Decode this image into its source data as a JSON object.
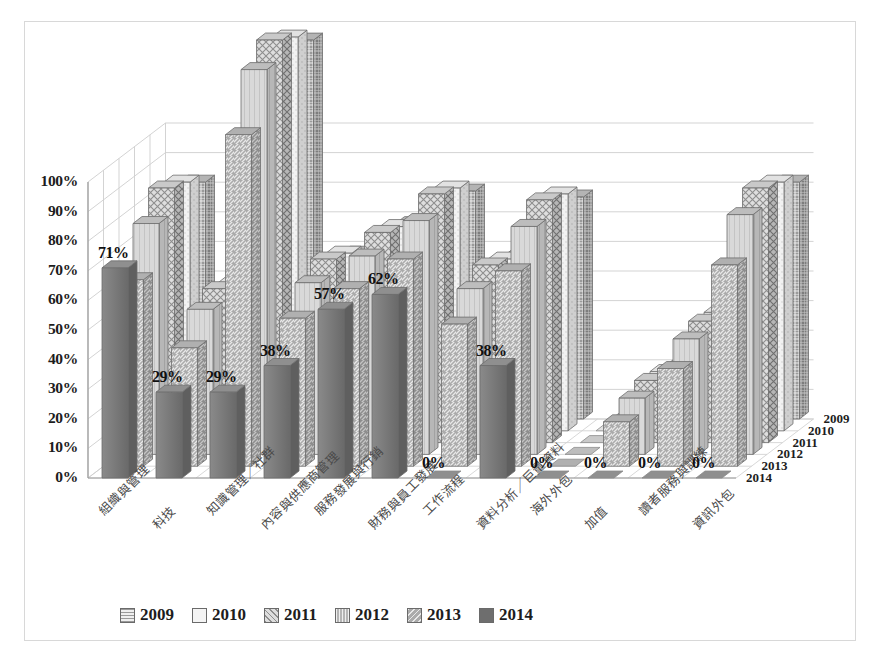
{
  "chart_data": {
    "type": "bar",
    "title": "",
    "subtitle": "",
    "xlabel": "",
    "ylabel": "",
    "zlabel": "",
    "ylim": [
      0,
      100
    ],
    "yticks": [
      "0%",
      "10%",
      "20%",
      "30%",
      "40%",
      "50%",
      "60%",
      "70%",
      "80%",
      "90%",
      "100%"
    ],
    "ytick_values": [
      0,
      10,
      20,
      30,
      40,
      50,
      60,
      70,
      80,
      90,
      100
    ],
    "grid": true,
    "projection": "3d",
    "legend_position": "bottom",
    "categories": [
      "組織與管理",
      "科技",
      "知識管理／社群",
      "內容與供應商管理",
      "服務發展與行銷",
      "財務與員工發展",
      "工作流程",
      "資料分析／巨量資料",
      "海外外包",
      "加值",
      "讀者服務與訓練",
      "資訊外包"
    ],
    "z_categories": [
      "2009",
      "2010",
      "2011",
      "2012",
      "2013",
      "2014"
    ],
    "series": [
      {
        "name": "2009",
        "values": [
          80,
          47,
          128,
          56,
          66,
          77,
          55,
          75,
          0,
          18,
          38,
          80
        ]
      },
      {
        "name": "2010",
        "values": [
          84,
          50,
          133,
          60,
          69,
          82,
          58,
          80,
          0,
          20,
          40,
          84
        ]
      },
      {
        "name": "2011",
        "values": [
          86,
          52,
          136,
          62,
          71,
          84,
          60,
          82,
          0,
          21,
          41,
          86
        ]
      },
      {
        "name": "2012",
        "values": [
          78,
          49,
          130,
          58,
          67,
          79,
          56,
          77,
          0,
          19,
          39,
          81
        ]
      },
      {
        "name": "2013",
        "values": [
          63,
          40,
          112,
          50,
          60,
          70,
          48,
          66,
          0,
          15,
          33,
          68
        ]
      },
      {
        "name": "2014",
        "values": [
          71,
          29,
          29,
          38,
          57,
          62,
          0,
          38,
          0,
          0,
          0,
          0
        ]
      }
    ],
    "data_labels": [
      {
        "category": "組織與管理",
        "text": "71%"
      },
      {
        "category": "科技",
        "text": "29%"
      },
      {
        "category": "知識管理／社群",
        "text": "29%"
      },
      {
        "category": "內容與供應商管理",
        "text": "38%"
      },
      {
        "category": "服務發展與行銷",
        "text": "57%"
      },
      {
        "category": "財務與員工發展",
        "text": "62%"
      },
      {
        "category": "工作流程",
        "text": "0%"
      },
      {
        "category": "資料分析／巨量資料",
        "text": "38%"
      },
      {
        "category": "海外外包",
        "text": "0%"
      },
      {
        "category": "加值",
        "text": "0%"
      },
      {
        "category": "讀者服務與訓練",
        "text": "0%"
      },
      {
        "category": "資訊外包",
        "text": "0%"
      }
    ],
    "legend": [
      {
        "label": "2009",
        "pattern": "grid-dense",
        "color": "#8c8c8c"
      },
      {
        "label": "2010",
        "pattern": "solid-light",
        "color": "#efefef"
      },
      {
        "label": "2011",
        "pattern": "crosshatch",
        "color": "#cfcfcf"
      },
      {
        "label": "2012",
        "pattern": "vertical-lines",
        "color": "#b5b5b5"
      },
      {
        "label": "2013",
        "pattern": "diagonal-hatch",
        "color": "#a0a0a0"
      },
      {
        "label": "2014",
        "pattern": "solid-dark",
        "color": "#6e6e6e"
      }
    ]
  }
}
